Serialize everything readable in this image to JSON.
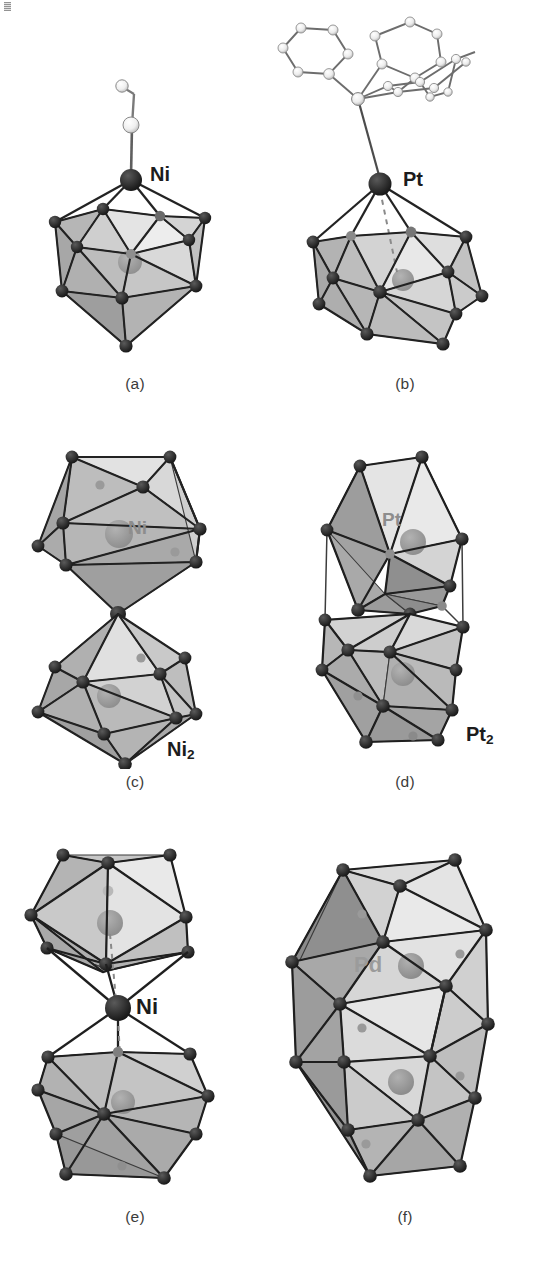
{
  "figure": {
    "kind": "crystal-structure-panels",
    "background": "#ffffff",
    "palette": {
      "vertex": "#262626",
      "edge": "#2b2b2b",
      "face_light": "#e9e9e9",
      "face_mid": "#c9c9c9",
      "face_dark": "#a5a5a5",
      "interstitial": "#9a9a9a",
      "ligand_sphere": "#efefef",
      "ligand_bond": "#6f6f6f",
      "label_dark": "#1c1c1c",
      "label_gray": "#8d8d8d"
    },
    "panels": [
      {
        "id": "a",
        "caption": "(a)",
        "labels": [
          {
            "text": "Ni",
            "tone": "dark"
          }
        ],
        "description": "Single centred icosahedron capped by one apical metal atom bearing a small ligand"
      },
      {
        "id": "b",
        "caption": "(b)",
        "labels": [
          {
            "text": "Pt",
            "tone": "dark"
          }
        ],
        "description": "Single centred icosahedron capped by an apical metal atom bearing a triphenylphosphine ligand"
      },
      {
        "id": "c",
        "caption": "(c)",
        "labels": [
          {
            "text": "Ni",
            "tone": "gray"
          },
          {
            "text": "Ni",
            "sub": "2",
            "tone": "dark"
          }
        ],
        "description": "Two centred icosahedra sharing a single common vertex"
      },
      {
        "id": "d",
        "caption": "(d)",
        "labels": [
          {
            "text": "Pt",
            "tone": "gray"
          },
          {
            "text": "Pt",
            "sub": "2",
            "tone": "dark"
          }
        ],
        "description": "Two centred icosahedra joined through a shared vertex within an outer cage"
      },
      {
        "id": "e",
        "caption": "(e)",
        "labels": [
          {
            "text": "Ni",
            "tone": "dark"
          }
        ],
        "description": "Two centred icosahedra bridged by a single interstitial metal atom"
      },
      {
        "id": "f",
        "caption": "(f)",
        "labels": [
          {
            "text": "Pd",
            "tone": "gray"
          }
        ],
        "description": "Elongated bi-icosahedral cage with two interstitial metal atoms"
      }
    ]
  }
}
